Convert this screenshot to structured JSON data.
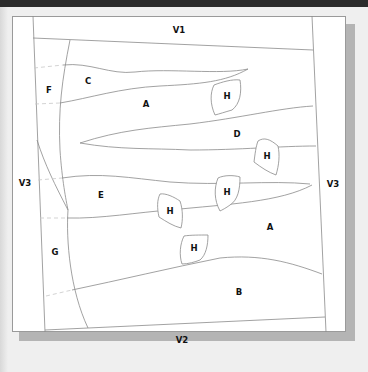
{
  "diagram": {
    "type": "zone-map",
    "colors": {
      "topbar": "#2b2b2b",
      "background": "#efefef",
      "paper": "#ffffff",
      "shadow": "#b4b4b4",
      "lines": "#8a8a8a",
      "dashed_lines": "#c8c8c8",
      "label_text": "#111111"
    },
    "labels": {
      "v1": "V1",
      "v2": "V2",
      "v3_left": "V3",
      "v3_right": "V3",
      "c": "C",
      "f": "F",
      "a_upper": "A",
      "d": "D",
      "e": "E",
      "a_lower": "A",
      "g": "G",
      "b": "B",
      "h1": "H",
      "h2": "H",
      "h3": "H",
      "h4": "H",
      "h5": "H"
    }
  }
}
